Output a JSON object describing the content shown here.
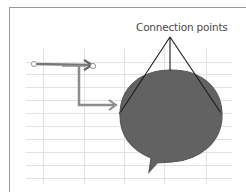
{
  "diagram": {
    "annotation_label": "Connection points",
    "shapes": [
      {
        "type": "speech-bubble",
        "fill": "#616161",
        "stroke": "#555555"
      },
      {
        "type": "elbow-connector",
        "color": "#8a8a8a"
      },
      {
        "type": "straight-connector",
        "color": "#7a7a7a",
        "endpoints": "circle-handles"
      }
    ],
    "colors": {
      "gridline": "#e2e2e2",
      "frame": "#9a9a9a",
      "callout_lines": "#111111",
      "bubble_fill": "#616161"
    }
  }
}
